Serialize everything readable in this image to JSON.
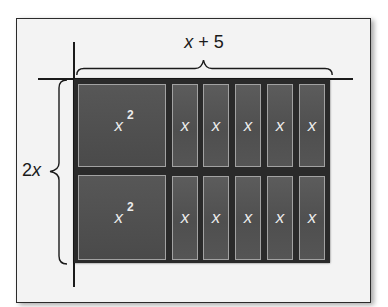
{
  "diagram": {
    "type": "algebra-tile-area-model",
    "top_dimension_label": {
      "variable": "x",
      "operator": "+",
      "constant": "5"
    },
    "left_dimension_label": {
      "coefficient": "2",
      "variable": "x"
    },
    "rows": [
      {
        "tiles": [
          {
            "kind": "x-squared",
            "base": "x",
            "exponent": "2"
          },
          {
            "kind": "x",
            "label": "x"
          },
          {
            "kind": "x",
            "label": "x"
          },
          {
            "kind": "x",
            "label": "x"
          },
          {
            "kind": "x",
            "label": "x"
          },
          {
            "kind": "x",
            "label": "x"
          }
        ]
      },
      {
        "tiles": [
          {
            "kind": "x-squared",
            "base": "x",
            "exponent": "2"
          },
          {
            "kind": "x",
            "label": "x"
          },
          {
            "kind": "x",
            "label": "x"
          },
          {
            "kind": "x",
            "label": "x"
          },
          {
            "kind": "x",
            "label": "x"
          },
          {
            "kind": "x",
            "label": "x"
          }
        ]
      }
    ],
    "colors": {
      "frame_border": "#2b2b2b",
      "frame_background": "#f3f3f3",
      "tile_backing": "#2a2a2a",
      "tile_fill": "#555555",
      "tile_outline": "#a2a2a2",
      "tile_text": "#ececec",
      "label_text": "#1a1a1a"
    }
  }
}
